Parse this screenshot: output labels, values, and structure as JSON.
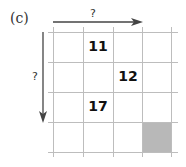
{
  "figure": {
    "label": "(c)",
    "horizontal_arrow_label": "?",
    "vertical_arrow_label": "?",
    "grid": {
      "columns": 4,
      "rows": 4,
      "cells": [
        {
          "row": 0,
          "col": 1,
          "value": "11"
        },
        {
          "row": 1,
          "col": 2,
          "value": "12"
        },
        {
          "row": 2,
          "col": 1,
          "value": "17"
        }
      ],
      "shaded_cell": {
        "row": 3,
        "col": 3,
        "color": "#b8b8b8"
      },
      "line_color": "#bdbdbd"
    },
    "arrow_color": "#444444"
  }
}
